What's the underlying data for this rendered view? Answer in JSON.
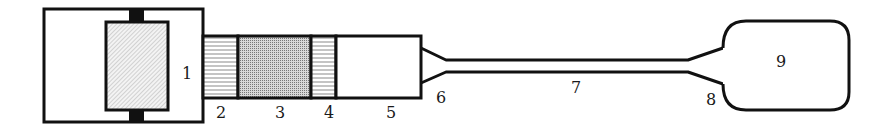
{
  "diagram": {
    "type": "schematic",
    "colors": {
      "stroke": "#111111",
      "background": "#ffffff",
      "stipple": "#888888",
      "hatch": "#9a9a9a"
    },
    "labels": [
      {
        "id": "1",
        "text": "1",
        "x": 182,
        "y": 79
      },
      {
        "id": "2",
        "text": "2",
        "x": 216,
        "y": 118
      },
      {
        "id": "3",
        "text": "3",
        "x": 275,
        "y": 118
      },
      {
        "id": "4",
        "text": "4",
        "x": 324,
        "y": 118
      },
      {
        "id": "5",
        "text": "5",
        "x": 386,
        "y": 118
      },
      {
        "id": "6",
        "text": "6",
        "x": 436,
        "y": 103
      },
      {
        "id": "7",
        "text": "7",
        "x": 571,
        "y": 93
      },
      {
        "id": "8",
        "text": "8",
        "x": 706,
        "y": 105
      },
      {
        "id": "9",
        "text": "9",
        "x": 776,
        "y": 67
      }
    ]
  }
}
